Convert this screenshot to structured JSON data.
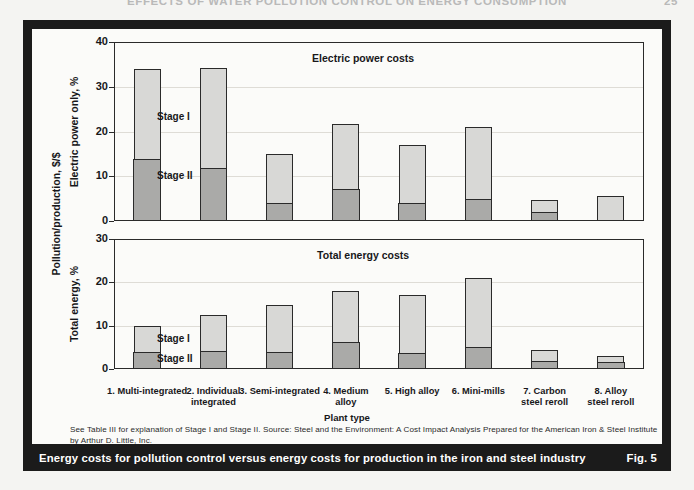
{
  "running_head": {
    "text": "EFFECTS OF WATER POLLUTION CONTROL ON ENERGY CONSUMPTION",
    "page_number": "25"
  },
  "axis": {
    "y_outer_title": "Pollution/production, $/$",
    "x_title": "Plant type"
  },
  "legend": {
    "stage1": "Stage I",
    "stage2": "Stage II"
  },
  "categories": [
    "1. Multi-integrated",
    "2. Individual\nintegrated",
    "3. Semi-integrated",
    "4. Medium\nalloy",
    "5. High alloy",
    "6. Mini-mills",
    "7. Carbon\nsteel reroll",
    "8. Alloy\nsteel reroll"
  ],
  "footnote": "See Table III for explanation of Stage I and Stage II.  Source: Steel and the Environment:  A Cost Impact Analysis Prepared for the American Iron & Steel Institute by  Arthur D. Little, Inc.",
  "caption": {
    "text": "Energy costs for pollution control versus energy costs for production in the iron and steel industry",
    "fig_number": "Fig. 5"
  },
  "colors": {
    "stage1_fill": "#d8d8d6",
    "stage2_fill": "#aaaaa8",
    "outline": "#2a2a2a",
    "frame": "#1b1b1b",
    "panel_bg": "#fbfbf9",
    "gridline": "#dedcd6"
  },
  "chart_data": [
    {
      "type": "bar",
      "id": "electric-power-costs",
      "title": "Electric power costs",
      "stacked": true,
      "xlabel": "Plant type",
      "ylabel": "Electric power only, %",
      "ylim": [
        0,
        40
      ],
      "yticks": [
        0,
        10,
        20,
        30,
        40
      ],
      "ytick_labels": [
        "0",
        "10",
        "20",
        "30",
        "40"
      ],
      "grid": true,
      "legend_position": "inside-left",
      "categories": [
        "1. Multi-integrated",
        "2. Individual integrated",
        "3. Semi-integrated",
        "4. Medium alloy",
        "5. High alloy",
        "6. Mini-mills",
        "7. Carbon steel reroll",
        "8. Alloy steel reroll"
      ],
      "series": [
        {
          "name": "Stage II",
          "values": [
            14.0,
            12.0,
            4.0,
            7.3,
            4.0,
            5.0,
            2.0,
            0.0
          ]
        },
        {
          "name": "Stage I",
          "values": [
            20.0,
            22.2,
            10.9,
            14.4,
            13.0,
            16.0,
            2.8,
            5.5
          ]
        }
      ],
      "totals": [
        34.0,
        34.2,
        14.9,
        21.7,
        17.0,
        21.0,
        4.8,
        5.5
      ]
    },
    {
      "type": "bar",
      "id": "total-energy-costs",
      "title": "Total energy costs",
      "stacked": true,
      "xlabel": "Plant type",
      "ylabel": "Total energy, %",
      "ylim": [
        0,
        30
      ],
      "yticks": [
        0,
        10,
        20,
        30
      ],
      "ytick_labels": [
        "0",
        "10",
        "20",
        "30"
      ],
      "grid": true,
      "legend_position": "inside-left",
      "categories": [
        "1. Multi-integrated",
        "2. Individual integrated",
        "3. Semi-integrated",
        "4. Medium alloy",
        "5. High alloy",
        "6. Mini-mills",
        "7. Carbon steel reroll",
        "8. Alloy steel reroll"
      ],
      "series": [
        {
          "name": "Stage II",
          "values": [
            4.0,
            4.2,
            4.0,
            6.2,
            3.7,
            5.2,
            1.8,
            1.6
          ]
        },
        {
          "name": "Stage I",
          "values": [
            5.9,
            8.3,
            10.7,
            11.8,
            13.3,
            15.8,
            2.5,
            1.3
          ]
        }
      ],
      "totals": [
        9.9,
        12.5,
        14.7,
        18.0,
        17.0,
        21.0,
        4.3,
        2.9
      ]
    }
  ]
}
